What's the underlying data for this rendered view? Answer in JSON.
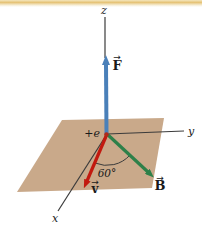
{
  "diagram": {
    "axis_labels": {
      "z": "z",
      "y": "y",
      "x": "x"
    },
    "vector_labels": {
      "force": "F",
      "velocity": "v",
      "field": "B",
      "vector_mark": "→"
    },
    "charge_label": "+e",
    "angle_label": "60°",
    "colors": {
      "plane": "#c9a98a",
      "force": "#4a80b9",
      "velocity": "#c2190f",
      "field": "#2d8049",
      "axis": "#3b3b3b",
      "charge_dot": "#b02a1a",
      "top_band": "#e5c377"
    }
  }
}
